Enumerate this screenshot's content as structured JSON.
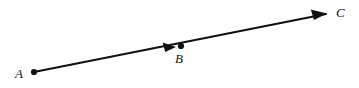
{
  "figure": {
    "width": 359,
    "height": 88,
    "background_color": "#ffffff",
    "stroke_color": "#101010",
    "line_width": 2
  },
  "labels": {
    "a": "A",
    "b": "B",
    "c": "C"
  },
  "geometry": {
    "points": [
      {
        "name": "A",
        "x": 34,
        "y": 72,
        "marker": "filled-dot",
        "radius": 3
      },
      {
        "name": "B",
        "x": 181,
        "y": 46,
        "marker": "filled-dot",
        "radius": 3
      },
      {
        "name": "C",
        "x": 342,
        "y": 13,
        "marker": "none",
        "radius": 0
      }
    ],
    "segments": [
      {
        "name": "ray-A-to-C",
        "from_x": 34,
        "from_y": 72,
        "to_x": 326,
        "to_y": 14
      }
    ],
    "arrowheads": [
      {
        "name": "mid-arrow-before-B",
        "tip_x": 176,
        "tip_y": 47,
        "direction": "up-right"
      },
      {
        "name": "end-arrow-toward-C",
        "tip_x": 326,
        "tip_y": 14,
        "direction": "up-right"
      }
    ]
  }
}
